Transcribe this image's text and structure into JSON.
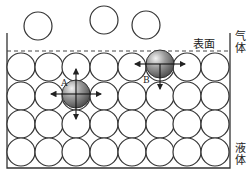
{
  "diagram": {
    "type": "liquid surface tension molecular model",
    "labels": {
      "surface": "表面",
      "gas": "气体",
      "liquid": "液体",
      "molecule_a": "A",
      "molecule_b": "B"
    },
    "gas_molecules": [
      {
        "cx": 38,
        "cy": 26,
        "r": 14
      },
      {
        "cx": 104,
        "cy": 20,
        "r": 14
      },
      {
        "cx": 146,
        "cy": 25,
        "r": 14
      }
    ],
    "liquid_grid": {
      "columns_x": [
        21,
        49,
        76,
        104,
        132,
        160,
        187,
        215
      ],
      "rows_y": [
        67,
        96,
        124,
        152
      ],
      "r": 14
    },
    "molecule_a": {
      "cx": 76,
      "cy": 94,
      "r": 14,
      "forces": [
        "up",
        "down",
        "left",
        "right"
      ]
    },
    "molecule_b": {
      "cx": 160,
      "cy": 64,
      "r": 14,
      "forces": [
        "down",
        "left",
        "right"
      ]
    },
    "colors": {
      "line": "#333333",
      "shaded": "#8a8a8a"
    }
  }
}
